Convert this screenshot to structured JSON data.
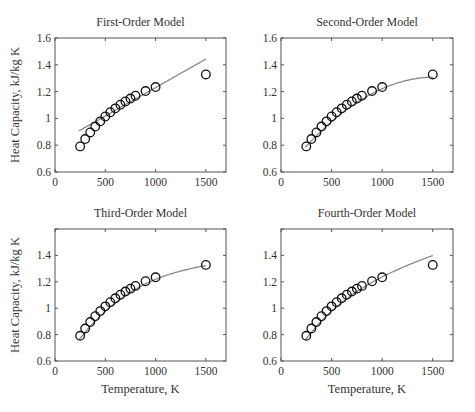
{
  "chart_data": [
    {
      "type": "scatter",
      "title": "First-Order Model",
      "xlabel": "",
      "ylabel": "Heat Capacity, kJ/kg K",
      "xlim": [
        0,
        1700
      ],
      "ylim": [
        0.6,
        1.6
      ],
      "xticks": [
        0,
        500,
        1000,
        1500
      ],
      "yticks": [
        0.6,
        0.8,
        1,
        1.2,
        1.4,
        1.6
      ],
      "ytick_labels": [
        "0.6",
        "0.8",
        "1",
        "1.2",
        "1.4",
        "1.6"
      ],
      "grid": false,
      "series": [
        {
          "name": "data",
          "marker": "o",
          "x": [
            250,
            300,
            350,
            400,
            450,
            500,
            550,
            600,
            650,
            700,
            750,
            800,
            900,
            1000,
            1500
          ],
          "y": [
            0.791,
            0.846,
            0.895,
            0.939,
            0.978,
            1.014,
            1.046,
            1.075,
            1.102,
            1.126,
            1.148,
            1.169,
            1.204,
            1.234,
            1.328
          ]
        },
        {
          "name": "fit (order 1)",
          "line": true,
          "coeffs": [
            0.8057,
            0.0004245
          ]
        }
      ]
    },
    {
      "type": "scatter",
      "title": "Second-Order Model",
      "xlabel": "",
      "ylabel": "",
      "xlim": [
        0,
        1700
      ],
      "ylim": [
        0.6,
        1.6
      ],
      "xticks": [
        0,
        500,
        1000,
        1500
      ],
      "yticks": [
        0.6,
        0.8,
        1,
        1.2,
        1.4,
        1.6
      ],
      "ytick_labels": [
        "0.6",
        "0.8",
        "1",
        "1.2",
        "1.4",
        "1.6"
      ],
      "grid": false,
      "series": [
        {
          "name": "data",
          "marker": "o",
          "x": [
            250,
            300,
            350,
            400,
            450,
            500,
            550,
            600,
            650,
            700,
            750,
            800,
            900,
            1000,
            1500
          ],
          "y": [
            0.791,
            0.846,
            0.895,
            0.939,
            0.978,
            1.014,
            1.046,
            1.075,
            1.102,
            1.126,
            1.148,
            1.169,
            1.204,
            1.234,
            1.328
          ]
        },
        {
          "name": "fit (order 2)",
          "line": true,
          "coeffs": [
            0.5688,
            0.0009727,
            -3.2e-07
          ]
        }
      ]
    },
    {
      "type": "scatter",
      "title": "Third-Order Model",
      "xlabel": "Temperature, K",
      "ylabel": "Heat Capacity, kJ/kg K",
      "xlim": [
        0,
        1700
      ],
      "ylim": [
        0.6,
        1.6
      ],
      "xticks": [
        0,
        500,
        1000,
        1500
      ],
      "yticks": [
        0.6,
        0.8,
        1,
        1.2,
        1.4,
        1.6
      ],
      "ytick_labels": [
        "0.6",
        "0.8",
        "1",
        "1.2",
        "1.4",
        ""
      ],
      "grid": false,
      "series": [
        {
          "name": "data",
          "marker": "o",
          "x": [
            250,
            300,
            350,
            400,
            450,
            500,
            550,
            600,
            650,
            700,
            750,
            800,
            900,
            1000,
            1500
          ],
          "y": [
            0.791,
            0.846,
            0.895,
            0.939,
            0.978,
            1.014,
            1.046,
            1.075,
            1.102,
            1.126,
            1.148,
            1.169,
            1.204,
            1.234,
            1.328
          ]
        },
        {
          "name": "fit (order 3)",
          "line": true,
          "coeffs": [
            0.4973,
            0.001259,
            -6.69e-07,
            1.31e-10
          ]
        }
      ]
    },
    {
      "type": "scatter",
      "title": "Fourth-Order Model",
      "xlabel": "Temperature, K",
      "ylabel": "",
      "xlim": [
        0,
        1700
      ],
      "ylim": [
        0.6,
        1.6
      ],
      "xticks": [
        0,
        500,
        1000,
        1500
      ],
      "yticks": [
        0.6,
        0.8,
        1,
        1.2,
        1.4,
        1.6
      ],
      "ytick_labels": [
        "0.6",
        "0.8",
        "1",
        "1.2",
        "1.4",
        ""
      ],
      "grid": false,
      "series": [
        {
          "name": "data",
          "marker": "o",
          "x": [
            250,
            300,
            350,
            400,
            450,
            500,
            550,
            600,
            650,
            700,
            750,
            800,
            900,
            1000,
            1500
          ],
          "y": [
            0.791,
            0.846,
            0.895,
            0.939,
            0.978,
            1.014,
            1.046,
            1.075,
            1.102,
            1.126,
            1.148,
            1.169,
            1.204,
            1.234,
            1.328
          ]
        },
        {
          "name": "fit (order 4)",
          "line": true,
          "coeffs": [
            0.4767,
            0.001386,
            -9.47e-07,
            3.86e-10,
            -6.5e-14
          ]
        }
      ]
    }
  ],
  "layout": {
    "panels": [
      {
        "left": 55,
        "top": 38,
        "right": 226,
        "bottom": 172
      },
      {
        "left": 281,
        "top": 38,
        "right": 453,
        "bottom": 172
      },
      {
        "left": 55,
        "top": 229,
        "right": 226,
        "bottom": 361
      },
      {
        "left": 281,
        "top": 229,
        "right": 453,
        "bottom": 361
      }
    ]
  }
}
